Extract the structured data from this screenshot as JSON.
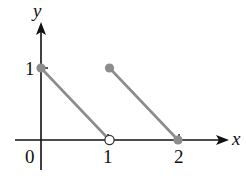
{
  "chart_data": {
    "type": "line",
    "title": "",
    "xlabel": "x",
    "ylabel": "y",
    "xlim": [
      -0.35,
      2.7
    ],
    "ylim": [
      -0.4,
      1.75
    ],
    "grid": false,
    "x_ticks": [
      {
        "value": 1,
        "label": "1"
      },
      {
        "value": 2,
        "label": "2"
      }
    ],
    "y_ticks": [
      {
        "value": 1,
        "label": "1"
      }
    ],
    "origin_label": "0",
    "series": [
      {
        "name": "segment-1",
        "x": [
          0,
          1
        ],
        "y": [
          1,
          0
        ],
        "start_point": "closed",
        "end_point": "open"
      },
      {
        "name": "segment-2",
        "x": [
          1,
          2
        ],
        "y": [
          1,
          0
        ],
        "start_point": "closed",
        "end_point": "closed"
      }
    ],
    "colors": {
      "segment": "#8c8c8c",
      "axis": "#111111",
      "point_fill": "#8c8c8c",
      "open_point_fill": "#ffffff"
    }
  }
}
